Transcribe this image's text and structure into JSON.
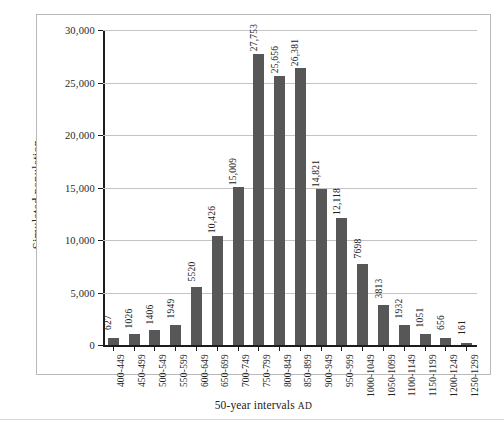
{
  "chart_data": {
    "type": "bar",
    "title": "",
    "xlabel": "50-year intervals AD",
    "xlabel_main": "50-year intervals",
    "xlabel_suffix": "AD",
    "ylabel": "Simulated population",
    "ylim": [
      0,
      30000
    ],
    "ytick_labels": [
      "30,000",
      "25,000",
      "20,000",
      "15,000",
      "10,000",
      "5,000",
      "0"
    ],
    "ytick_values": [
      30000,
      25000,
      20000,
      15000,
      10000,
      5000,
      0
    ],
    "grid": "horizontal",
    "legend": "none",
    "bar_color": "#575757",
    "categories": [
      "400-449",
      "450-499",
      "500-549",
      "550-599",
      "600-649",
      "650-699",
      "700-749",
      "750-799",
      "800-849",
      "850-899",
      "900-949",
      "950-999",
      "1000-1049",
      "1050-1099",
      "1100-1149",
      "1150-1199",
      "1200-1249",
      "1250-1299"
    ],
    "values": [
      627,
      1026,
      1406,
      1949,
      5520,
      10426,
      15009,
      27753,
      25656,
      26381,
      14821,
      12118,
      7698,
      3813,
      1932,
      1051,
      656,
      161
    ],
    "value_labels": [
      "627",
      "1026",
      "1406",
      "1949",
      "5520",
      "10,426",
      "15,009",
      "27,753",
      "25,656",
      "26,381",
      "14,821",
      "12,118",
      "7698",
      "3813",
      "1932",
      "1051",
      "656",
      "161"
    ]
  },
  "caption": {
    "text": ""
  }
}
